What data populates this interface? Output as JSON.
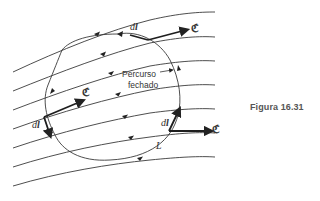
{
  "figure": {
    "caption": "Figura 16.31",
    "closed_path_label_line1": "Percurso",
    "closed_path_label_line2": "fechado",
    "path_name": "L",
    "field_symbol": "ℭ",
    "element_symbol_d": "d",
    "element_symbol_l": "l",
    "colors": {
      "stroke": "#3a3a3a",
      "text": "#333333",
      "caption": "#555555",
      "background": "#ffffff"
    }
  },
  "field_lines": [
    {
      "id": 1,
      "start": [
        13,
        72
      ],
      "end": [
        215,
        12
      ]
    },
    {
      "id": 2,
      "start": [
        13,
        91
      ],
      "end": [
        215,
        37
      ]
    },
    {
      "id": 3,
      "start": [
        13,
        110
      ],
      "end": [
        215,
        61
      ]
    },
    {
      "id": 4,
      "start": [
        13,
        129
      ],
      "end": [
        215,
        85
      ]
    },
    {
      "id": 5,
      "start": [
        13,
        148
      ],
      "end": [
        215,
        109
      ]
    },
    {
      "id": 6,
      "start": [
        13,
        167
      ],
      "end": [
        215,
        133
      ]
    },
    {
      "id": 7,
      "start": [
        13,
        186
      ],
      "end": [
        215,
        157
      ]
    }
  ],
  "vectors": [
    {
      "label": "field-vector-top",
      "at": [
        148,
        40
      ]
    },
    {
      "label": "field-vector-left",
      "at": [
        44,
        117
      ]
    },
    {
      "label": "field-vector-bottom-right",
      "at": [
        169,
        131
      ]
    }
  ]
}
